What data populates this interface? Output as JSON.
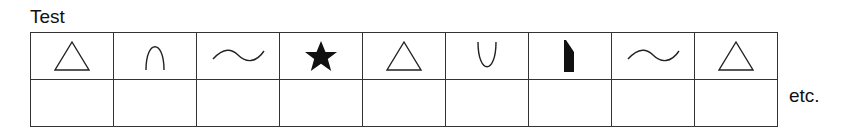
{
  "title": "Test",
  "trailing_text": "etc.",
  "columns": 9,
  "rows": 2,
  "symbols": [
    {
      "icon": "triangle-outline-icon"
    },
    {
      "icon": "arch-up-icon"
    },
    {
      "icon": "wave-icon"
    },
    {
      "icon": "star-filled-icon"
    },
    {
      "icon": "triangle-outline-icon"
    },
    {
      "icon": "arch-down-icon"
    },
    {
      "icon": "beveled-block-icon"
    },
    {
      "icon": "wave-icon"
    },
    {
      "icon": "triangle-outline-icon"
    }
  ],
  "answers": [
    "",
    "",
    "",
    "",
    "",
    "",
    "",
    "",
    ""
  ],
  "colors": {
    "ink": "#111111",
    "grid": "#333333",
    "background": "#ffffff"
  }
}
